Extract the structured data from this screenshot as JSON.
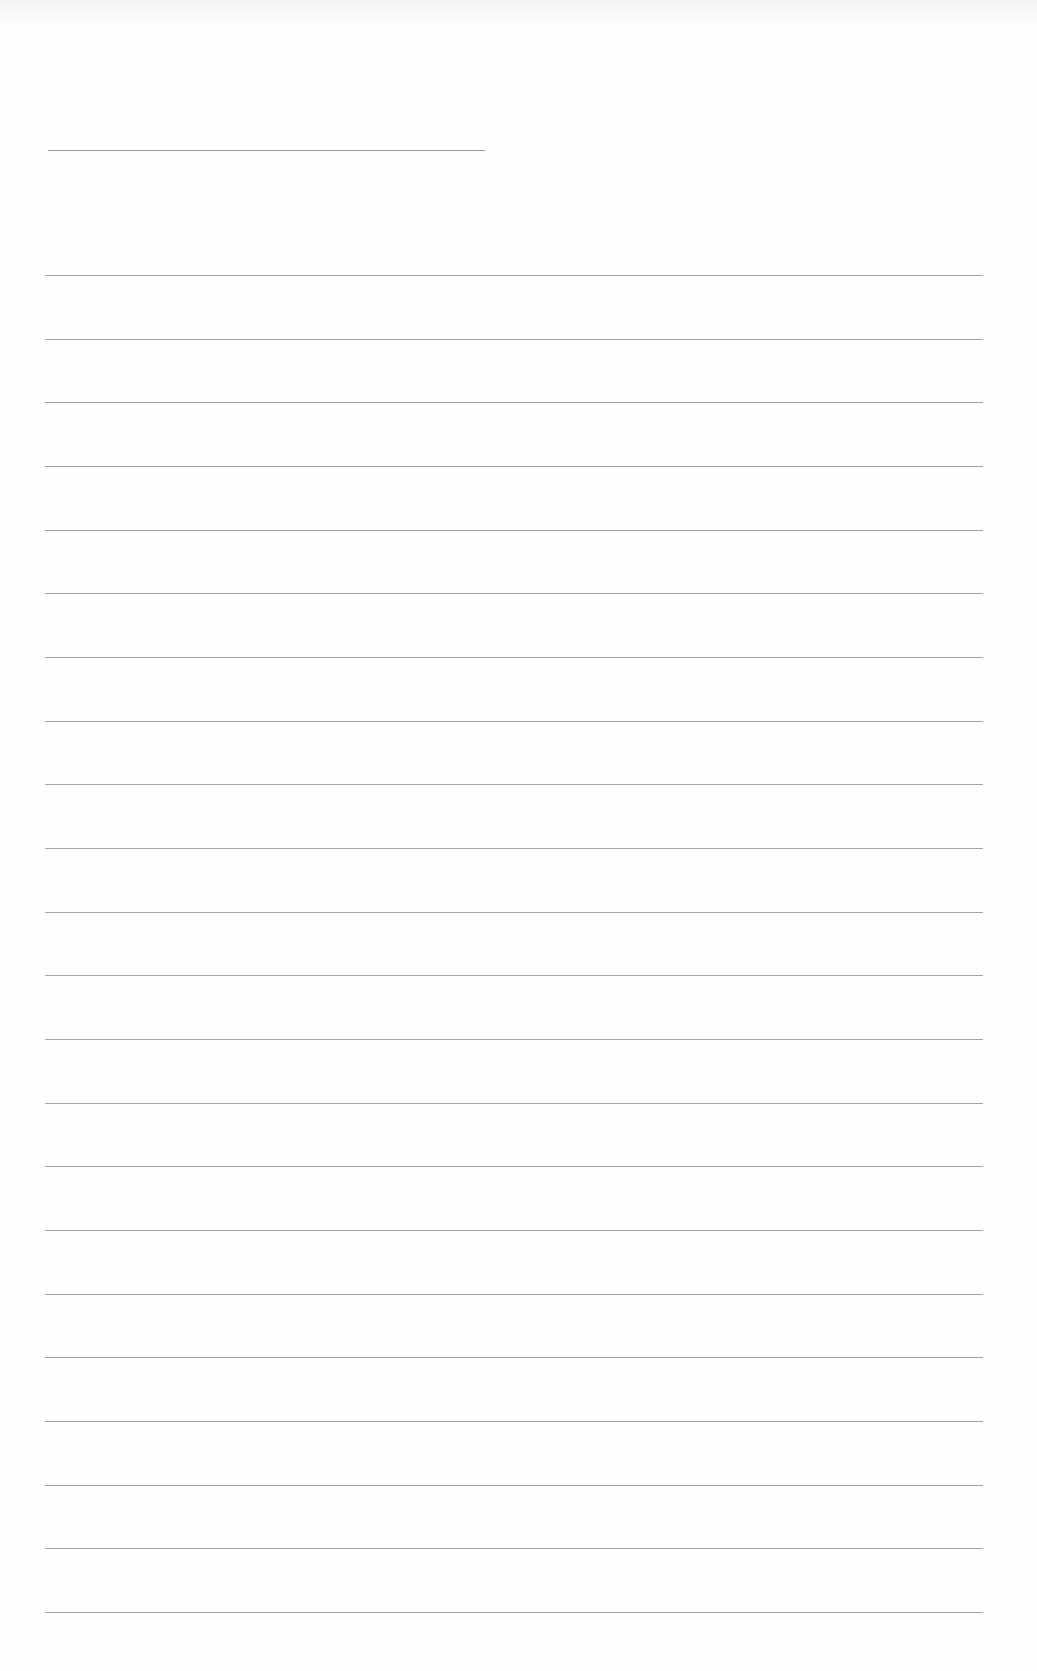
{
  "document": {
    "type": "ruled-notebook-page",
    "background_color": "#fefefe",
    "line_color": "#8c8c8c",
    "header_line": {
      "y": 150,
      "x_start": 48,
      "x_end": 485
    },
    "ruled_lines": {
      "count": 22,
      "first_y": 275,
      "last_y": 1612,
      "x_start": 45,
      "x_end": 983
    },
    "text_content": ""
  }
}
